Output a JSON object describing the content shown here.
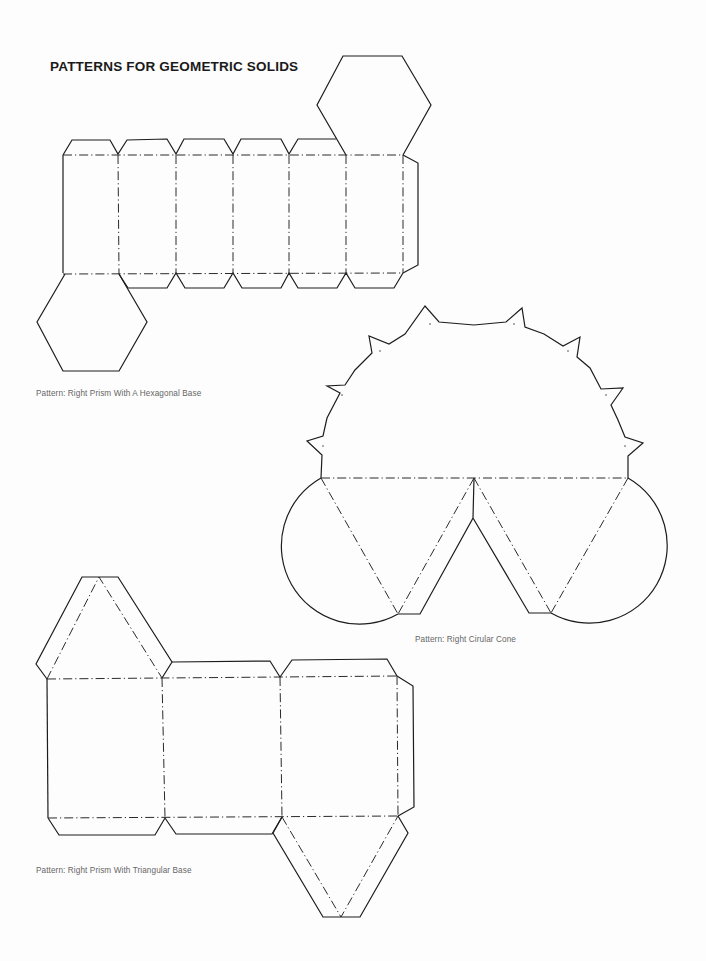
{
  "page": {
    "title": "PATTERNS FOR GEOMETRIC SOLIDS",
    "line_color": "#1c1c1c",
    "caption_color": "#666666"
  },
  "patterns": [
    {
      "id": "hexagonal-prism",
      "caption": "Pattern:  Right Prism With A Hexagonal Base",
      "faces": 6,
      "base_shape": "hexagon"
    },
    {
      "id": "circular-cone",
      "caption": "Pattern:  Right Cirular Cone",
      "sector": "semicircle",
      "glue_tabs": 8,
      "base_shape": "circle"
    },
    {
      "id": "triangular-prism",
      "caption": "Pattern:  Right Prism With Triangular Base",
      "faces": 3,
      "base_shape": "triangle"
    }
  ],
  "legend": {
    "solid_line": "cut line",
    "dash_dot_line": "fold line"
  }
}
